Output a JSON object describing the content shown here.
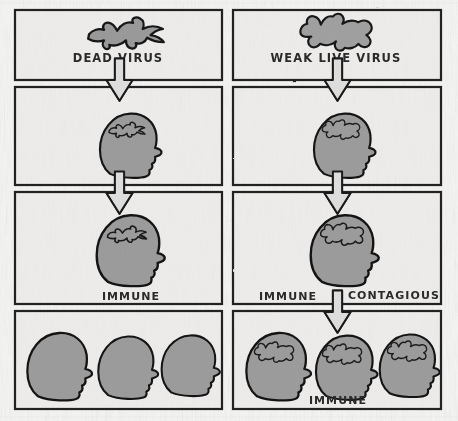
{
  "diagram": {
    "type": "comic-flow-diagram",
    "style": "hand-drawn pen and ink, grayscale, 2 columns x 4 rows of panels",
    "columns": [
      {
        "id": "left",
        "name": "dead-virus-column"
      },
      {
        "id": "right",
        "name": "weak-live-virus-column"
      }
    ],
    "palette": {
      "paper": "#f1f1ef",
      "panel_fill": "#ececeb",
      "ink": "#1c1c1c",
      "head_fill": "#9c9c9c",
      "head_fill_dark": "#8a8a8a",
      "virus_fill": "#9a9a9a",
      "arrow_fill": "#dcdcda",
      "label_ink": "#2a2a2a"
    }
  },
  "labels": {
    "dead_virus": "DEAD VIRUS",
    "weak_live_virus": "WEAK LIVE VIRUS",
    "immune_left": "IMMUNE",
    "immune_right": "IMMUNE",
    "contagious": "CONTAGIOUS",
    "immune_bottom": "IMMUNE"
  },
  "panels": {
    "row1": {
      "left": {
        "name": "panel-dead-virus",
        "caption": "DEAD VIRUS",
        "figure": "flat-splattered-virus-blob",
        "figure_count": 1
      },
      "right": {
        "name": "panel-weak-live-virus",
        "caption": "WEAK LIVE VIRUS",
        "figure": "plump-spiky-virus-blob",
        "figure_count": 1
      }
    },
    "row2": {
      "left": {
        "name": "panel-head-injected-dead",
        "caption": "",
        "figure": "head-profile-with-dead-virus",
        "figure_count": 1
      },
      "right": {
        "name": "panel-head-injected-live",
        "caption": "",
        "figure": "head-profile-with-live-virus",
        "figure_count": 1
      }
    },
    "row3": {
      "left": {
        "name": "panel-immune-dead",
        "caption": "IMMUNE",
        "figure": "head-profile-with-dead-virus",
        "figure_count": 1
      },
      "right": {
        "name": "panel-immune-contagious",
        "caption": "IMMUNE  CONTAGIOUS",
        "figure": "head-profile-with-live-virus",
        "figure_count": 1
      }
    },
    "row4": {
      "left": {
        "name": "panel-population-not-infected",
        "caption": "",
        "figure": "three-empty-head-profiles",
        "figure_count": 3
      },
      "right": {
        "name": "panel-population-immune",
        "caption": "IMMUNE",
        "figure": "three-head-profiles-with-live-virus",
        "figure_count": 3
      }
    }
  },
  "arrows": [
    {
      "name": "arrow-left-r1-r2",
      "direction": "down",
      "from": "row1-left",
      "to": "row2-left"
    },
    {
      "name": "arrow-right-r1-r2",
      "direction": "down",
      "from": "row1-right",
      "to": "row2-right"
    },
    {
      "name": "arrow-left-r2-r3",
      "direction": "down",
      "from": "row2-left",
      "to": "row3-left"
    },
    {
      "name": "arrow-right-r2-r3",
      "direction": "down",
      "from": "row2-right",
      "to": "row3-right"
    },
    {
      "name": "arrow-right-r3-r4",
      "direction": "down",
      "from": "row3-right",
      "to": "row4-right"
    }
  ]
}
